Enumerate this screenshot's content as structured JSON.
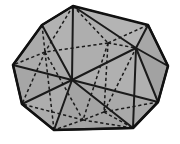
{
  "figure": {
    "name": "icosahedron",
    "canvas": {
      "width": 180,
      "height": 144
    },
    "colors": {
      "background": "#ffffff",
      "face_fill": "#a9a9a9",
      "face_fill_light": "#b4b4b4",
      "face_fill_dark": "#9e9e9e",
      "edge_visible": "#1a1a1a",
      "edge_hidden": "#1a1a1a",
      "silhouette": "#111111"
    },
    "strokes": {
      "silhouette_width": 2.6,
      "visible_width": 2.0,
      "hidden_width": 1.5,
      "hidden_dash": "3.2,2.6"
    },
    "vertices": {
      "top_apex": [
        73,
        6
      ],
      "upper_left": [
        42,
        25
      ],
      "upper_right": [
        148,
        25
      ],
      "left": [
        13,
        65
      ],
      "right": [
        168,
        66
      ],
      "lower_left": [
        22,
        104
      ],
      "lower_right": [
        158,
        102
      ],
      "bottom_left": [
        54,
        130
      ],
      "bottom_right": [
        133,
        128
      ],
      "interior_center": [
        72,
        80
      ],
      "interior_upper_mid": [
        108,
        43
      ],
      "interior_right_mid": [
        136,
        48
      ],
      "interior_left_mid": [
        45,
        52
      ],
      "interior_lower_mid": [
        104,
        112
      ],
      "interior_bottom_mid": [
        83,
        120
      ]
    },
    "silhouette_path": "M 73 6 L 148 25 L 168 66 L 158 102 L 133 128 L 54 130 L 22 104 L 13 65 L 42 25 Z",
    "visible_edges": [
      {
        "name": "apex-to-center",
        "from": [
          73,
          6
        ],
        "to": [
          72,
          80
        ]
      },
      {
        "name": "apex-to-upper-left",
        "from": [
          73,
          6
        ],
        "to": [
          42,
          25
        ]
      },
      {
        "name": "apex-to-right-mid",
        "from": [
          73,
          6
        ],
        "to": [
          136,
          48
        ]
      },
      {
        "name": "upper-left-to-left",
        "from": [
          42,
          25
        ],
        "to": [
          13,
          65
        ]
      },
      {
        "name": "upper-left-to-center",
        "from": [
          42,
          25
        ],
        "to": [
          72,
          80
        ]
      },
      {
        "name": "left-to-center",
        "from": [
          13,
          65
        ],
        "to": [
          72,
          80
        ]
      },
      {
        "name": "left-to-lower-left",
        "from": [
          13,
          65
        ],
        "to": [
          22,
          104
        ]
      },
      {
        "name": "center-to-right-mid",
        "from": [
          72,
          80
        ],
        "to": [
          136,
          48
        ]
      },
      {
        "name": "center-to-bottom-left",
        "from": [
          72,
          80
        ],
        "to": [
          54,
          130
        ]
      },
      {
        "name": "center-to-lower-right",
        "from": [
          72,
          80
        ],
        "to": [
          158,
          102
        ]
      },
      {
        "name": "center-to-bottom-right",
        "from": [
          72,
          80
        ],
        "to": [
          133,
          128
        ]
      },
      {
        "name": "right-mid-to-upper-right",
        "from": [
          136,
          48
        ],
        "to": [
          148,
          25
        ]
      },
      {
        "name": "right-mid-to-right",
        "from": [
          136,
          48
        ],
        "to": [
          168,
          66
        ]
      },
      {
        "name": "right-mid-to-lower-right",
        "from": [
          136,
          48
        ],
        "to": [
          158,
          102
        ]
      },
      {
        "name": "right-mid-to-bottom-right",
        "from": [
          136,
          48
        ],
        "to": [
          133,
          128
        ]
      },
      {
        "name": "upper-right-to-right",
        "from": [
          148,
          25
        ],
        "to": [
          168,
          66
        ]
      },
      {
        "name": "right-to-lower-right",
        "from": [
          168,
          66
        ],
        "to": [
          158,
          102
        ]
      },
      {
        "name": "lower-right-to-bottom-right",
        "from": [
          158,
          102
        ],
        "to": [
          133,
          128
        ]
      },
      {
        "name": "bottom-right-to-bottom-left",
        "from": [
          133,
          128
        ],
        "to": [
          54,
          130
        ]
      },
      {
        "name": "bottom-left-to-lower-left",
        "from": [
          54,
          130
        ],
        "to": [
          22,
          104
        ]
      },
      {
        "name": "lower-left-to-center",
        "from": [
          22,
          104
        ],
        "to": [
          72,
          80
        ]
      }
    ],
    "hidden_edges": [
      {
        "name": "apex-to-upper-mid",
        "from": [
          73,
          6
        ],
        "to": [
          108,
          43
        ]
      },
      {
        "name": "apex-to-left-mid",
        "from": [
          73,
          6
        ],
        "to": [
          45,
          52
        ]
      },
      {
        "name": "apex-to-upper-right",
        "from": [
          73,
          6
        ],
        "to": [
          148,
          25
        ]
      },
      {
        "name": "upper-left-to-left-mid",
        "from": [
          42,
          25
        ],
        "to": [
          45,
          52
        ]
      },
      {
        "name": "upper-mid-to-upper-right",
        "from": [
          108,
          43
        ],
        "to": [
          148,
          25
        ]
      },
      {
        "name": "upper-mid-to-left-mid",
        "from": [
          108,
          43
        ],
        "to": [
          45,
          52
        ]
      },
      {
        "name": "upper-mid-to-right-mid",
        "from": [
          108,
          43
        ],
        "to": [
          136,
          48
        ]
      },
      {
        "name": "upper-mid-to-lower-mid",
        "from": [
          108,
          43
        ],
        "to": [
          104,
          112
        ]
      },
      {
        "name": "upper-mid-to-bottom-mid",
        "from": [
          108,
          43
        ],
        "to": [
          83,
          120
        ]
      },
      {
        "name": "left-mid-to-left",
        "from": [
          45,
          52
        ],
        "to": [
          13,
          65
        ]
      },
      {
        "name": "left-mid-to-lower-left",
        "from": [
          45,
          52
        ],
        "to": [
          22,
          104
        ]
      },
      {
        "name": "left-mid-to-bottom-mid",
        "from": [
          45,
          52
        ],
        "to": [
          83,
          120
        ]
      },
      {
        "name": "left-mid-to-bottom-left",
        "from": [
          45,
          52
        ],
        "to": [
          54,
          130
        ]
      },
      {
        "name": "lower-mid-to-lower-right",
        "from": [
          104,
          112
        ],
        "to": [
          158,
          102
        ]
      },
      {
        "name": "lower-mid-to-bottom-right",
        "from": [
          104,
          112
        ],
        "to": [
          133,
          128
        ]
      },
      {
        "name": "lower-mid-to-bottom-mid",
        "from": [
          104,
          112
        ],
        "to": [
          83,
          120
        ]
      },
      {
        "name": "lower-mid-to-right-mid",
        "from": [
          104,
          112
        ],
        "to": [
          136,
          48
        ]
      },
      {
        "name": "bottom-mid-to-bottom-left",
        "from": [
          83,
          120
        ],
        "to": [
          54,
          130
        ]
      },
      {
        "name": "bottom-mid-to-bottom-right",
        "from": [
          83,
          120
        ],
        "to": [
          133,
          128
        ]
      },
      {
        "name": "bottom-mid-to-lower-left",
        "from": [
          83,
          120
        ],
        "to": [
          22,
          104
        ]
      }
    ],
    "shaded_faces": [
      {
        "name": "face-top-left",
        "shade": "#b2b2b2",
        "points": "73,6 42,25 72,80"
      },
      {
        "name": "face-left-upper",
        "shade": "#ababab",
        "points": "42,25 13,65 72,80"
      },
      {
        "name": "face-left-lower",
        "shade": "#a6a6a6",
        "points": "13,65 22,104 72,80"
      },
      {
        "name": "face-bottom-left",
        "shade": "#adadad",
        "points": "22,104 54,130 72,80"
      },
      {
        "name": "face-bottom-center",
        "shade": "#a4a4a4",
        "points": "54,130 133,128 72,80"
      },
      {
        "name": "face-bottom-right",
        "shade": "#a9a9a9",
        "points": "133,128 158,102 72,80"
      },
      {
        "name": "face-right-lower",
        "shade": "#b0b0b0",
        "points": "158,102 136,48 72,80"
      },
      {
        "name": "face-right-upper",
        "shade": "#aeaeae",
        "points": "136,48 73,6 72,80"
      },
      {
        "name": "face-top-right",
        "shade": "#b4b4b4",
        "points": "73,6 148,25 136,48"
      },
      {
        "name": "face-far-right",
        "shade": "#a7a7a7",
        "points": "148,25 168,66 136,48"
      },
      {
        "name": "face-right-edge",
        "shade": "#a2a2a2",
        "points": "168,66 158,102 136,48"
      }
    ]
  }
}
